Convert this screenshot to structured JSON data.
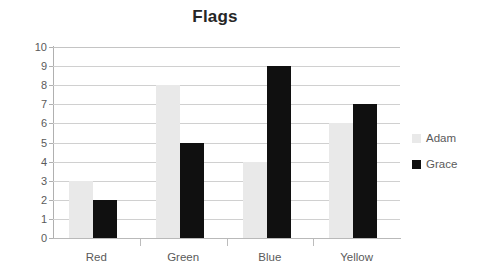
{
  "chart_data": {
    "type": "bar",
    "title": "Flags",
    "xlabel": "",
    "ylabel": "",
    "categories": [
      "Red",
      "Green",
      "Blue",
      "Yellow"
    ],
    "series": [
      {
        "name": "Adam",
        "values": [
          3,
          8,
          4,
          6
        ],
        "color": "#e9e9e9"
      },
      {
        "name": "Grace",
        "values": [
          2,
          5,
          9,
          7
        ],
        "color": "#101010"
      }
    ],
    "ylim": [
      0,
      10
    ],
    "ytick_step": 1,
    "yticks": [
      10,
      9,
      8,
      7,
      6,
      5,
      4,
      3,
      2,
      1,
      0
    ],
    "ytick_labels": [
      "10",
      "9",
      "8",
      "7",
      "6",
      "5",
      "4",
      "3",
      "2",
      "1",
      "0"
    ],
    "grid": true,
    "grid_axis": "y",
    "legend_position": "right",
    "background": "#ffffff",
    "grid_color": "#d0d0d0",
    "axis_color": "#b0b0b0",
    "text_color": "#5a5a5a",
    "title_color": "#262626"
  }
}
